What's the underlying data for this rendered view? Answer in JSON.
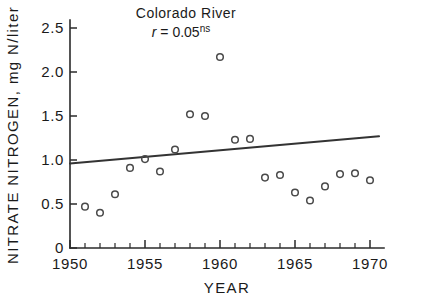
{
  "chart_data": {
    "type": "scatter",
    "title": "Colorado River",
    "annotation": {
      "symbol": "r",
      "equals": " = ",
      "value": "0.05",
      "superscript": "ns",
      "full_text": "r = 0.05ns"
    },
    "xlabel": "YEAR",
    "ylabel": "NITRATE NITROGEN, mg N/liter",
    "xlim": [
      1950,
      1971
    ],
    "ylim": [
      0,
      2.72
    ],
    "grid": false,
    "legend": "none",
    "x_tick_labels": [
      "1950",
      "1955",
      "1960",
      "1965",
      "1970"
    ],
    "x_tick_values": [
      1950,
      1955,
      1960,
      1965,
      1970
    ],
    "x_minor_tick_values": [
      1951,
      1952,
      1953,
      1954,
      1956,
      1957,
      1958,
      1959,
      1961,
      1962,
      1963,
      1964,
      1966,
      1967,
      1968,
      1969
    ],
    "y_tick_labels": [
      "0",
      "0.5",
      "1.0",
      "1.5",
      "2.0",
      "2.5"
    ],
    "y_tick_values": [
      0,
      0.5,
      1.0,
      1.5,
      2.0,
      2.5
    ],
    "x": [
      1951,
      1952,
      1953,
      1954,
      1955,
      1956,
      1957,
      1958,
      1959,
      1960,
      1961,
      1962,
      1963,
      1964,
      1965,
      1966,
      1967,
      1968,
      1969,
      1970
    ],
    "values": [
      0.47,
      0.4,
      0.61,
      0.91,
      1.01,
      0.87,
      1.12,
      1.52,
      1.5,
      2.17,
      1.23,
      1.24,
      0.8,
      0.83,
      0.63,
      0.54,
      0.7,
      0.84,
      0.85,
      0.77
    ],
    "series": [
      {
        "name": "Nitrate nitrogen observations",
        "marker": "open-circle",
        "x": [
          1951,
          1952,
          1953,
          1954,
          1955,
          1956,
          1957,
          1958,
          1959,
          1960,
          1961,
          1962,
          1963,
          1964,
          1965,
          1966,
          1967,
          1968,
          1969,
          1970
        ],
        "values": [
          0.47,
          0.4,
          0.61,
          0.91,
          1.01,
          0.87,
          1.12,
          1.52,
          1.5,
          2.17,
          1.23,
          1.24,
          0.8,
          0.83,
          0.63,
          0.54,
          0.7,
          0.84,
          0.85,
          0.77
        ]
      },
      {
        "name": "Linear regression trend",
        "marker": "line",
        "x": [
          1950,
          1970.6
        ],
        "values": [
          0.96,
          1.27
        ]
      }
    ]
  }
}
